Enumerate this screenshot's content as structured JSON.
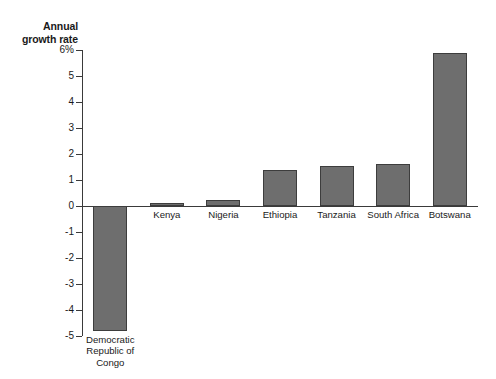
{
  "chart_data": {
    "type": "bar",
    "title": "Annual\ngrowth rate",
    "xlabel": "",
    "ylabel": "Annual growth rate",
    "ylim": [
      -5,
      6
    ],
    "grid": false,
    "legend": null,
    "unit": "%",
    "categories": [
      "Democratic\nRepublic of\nCongo",
      "Kenya",
      "Nigeria",
      "Ethiopia",
      "Tanzania",
      "South Africa",
      "Botswana"
    ],
    "values": [
      -4.8,
      0.1,
      0.25,
      1.4,
      1.55,
      1.6,
      5.9
    ],
    "yticks": [
      {
        "value": 6,
        "label": "6%"
      },
      {
        "value": 5,
        "label": "5"
      },
      {
        "value": 4,
        "label": "4"
      },
      {
        "value": 3,
        "label": "3"
      },
      {
        "value": 2,
        "label": "2"
      },
      {
        "value": 1,
        "label": "1"
      },
      {
        "value": 0,
        "label": "0"
      },
      {
        "value": -1,
        "label": "-1"
      },
      {
        "value": -2,
        "label": "-2"
      },
      {
        "value": -3,
        "label": "-3"
      },
      {
        "value": -4,
        "label": "-4"
      },
      {
        "value": -5,
        "label": "-5"
      }
    ],
    "colors": {
      "bar_fill": "#6e6e6e",
      "bar_stroke": "#3d3d3d",
      "axis": "#3a3a3a",
      "text": "#1a1a1a",
      "background": "#ffffff"
    }
  }
}
